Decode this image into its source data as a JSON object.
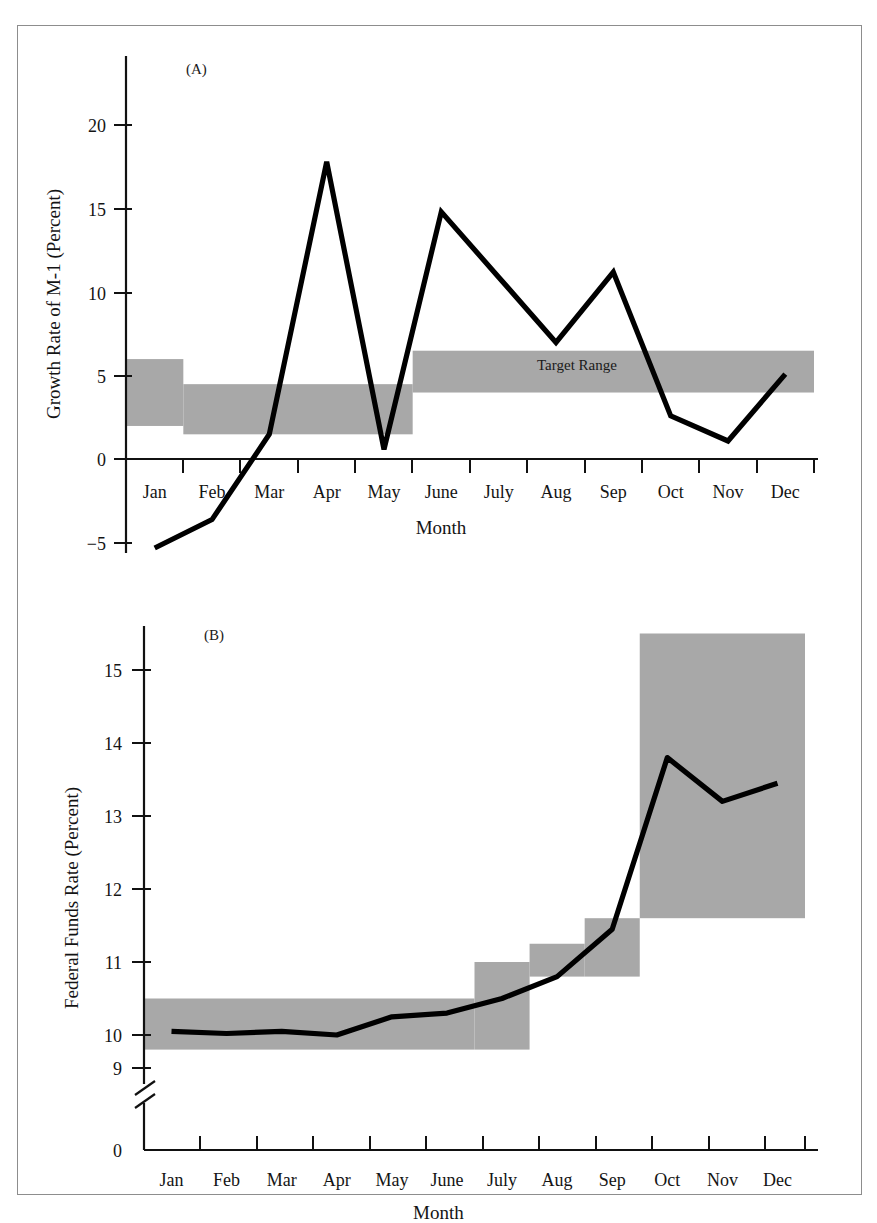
{
  "figure": {
    "background": "#ffffff",
    "border_color": "#8d8d8d",
    "line_color": "#000000",
    "band_color": "#a8a8a8"
  },
  "panel_a": {
    "label": "(A)",
    "band_annotation": "Target Range",
    "ylabel": "Growth Rate of M-1 (Percent)",
    "xlabel": "Month"
  },
  "panel_b": {
    "label": "(B)",
    "ylabel": "Federal Funds Rate (Percent)",
    "xlabel": "Month",
    "axis_break": "axis-break-mark"
  },
  "chart_data": [
    {
      "type": "line",
      "id": "panel-a",
      "title": "(A)",
      "xlabel": "Month",
      "ylabel": "Growth Rate of M-1 (Percent)",
      "categories": [
        "Jan",
        "Feb",
        "Mar",
        "Apr",
        "May",
        "June",
        "July",
        "Aug",
        "Sep",
        "Oct",
        "Nov",
        "Dec"
      ],
      "values": [
        -5.3,
        -3.6,
        1.5,
        17.8,
        0.6,
        14.8,
        10.9,
        7.0,
        11.2,
        2.6,
        1.1,
        5.1
      ],
      "ytick_labels": [
        "20",
        "15",
        "10",
        "5",
        "0",
        "-5"
      ],
      "ytick_values": [
        20,
        15,
        10,
        5,
        0,
        -5
      ],
      "ylim": [
        -7,
        22.5
      ],
      "grid": false,
      "legend": "none",
      "annotations": [
        {
          "text": "Target Range",
          "x_category": "June",
          "y": 5.3
        }
      ],
      "bands": [
        {
          "name": "target-range-q1",
          "start_month": "Jan",
          "end_month": "Feb",
          "low": 2.0,
          "high": 6.0
        },
        {
          "name": "target-range-q2",
          "start_month": "Feb",
          "end_month": "June",
          "low": 1.5,
          "high": 4.5
        },
        {
          "name": "target-range-q3",
          "start_month": "June",
          "end_month": "Dec",
          "low": 4.0,
          "high": 6.5
        }
      ]
    },
    {
      "type": "line",
      "id": "panel-b",
      "title": "(B)",
      "xlabel": "Month",
      "ylabel": "Federal Funds Rate (Percent)",
      "categories": [
        "Jan",
        "Feb",
        "Mar",
        "Apr",
        "May",
        "June",
        "July",
        "Aug",
        "Sep",
        "Oct",
        "Nov",
        "Dec"
      ],
      "values": [
        10.05,
        10.02,
        10.05,
        10.0,
        10.25,
        10.3,
        10.5,
        10.8,
        11.45,
        13.8,
        13.2,
        13.45
      ],
      "ytick_labels": [
        "15",
        "14",
        "13",
        "12",
        "11",
        "10",
        "9",
        "0"
      ],
      "ytick_values": [
        15,
        14,
        13,
        12,
        11,
        10,
        9,
        0
      ],
      "ylim": [
        8.6,
        15.7
      ],
      "axis_break_between": [
        0,
        9
      ],
      "grid": false,
      "legend": "none",
      "bands": [
        {
          "name": "ffr-band-1",
          "start_month": "Jan",
          "end_month": "July",
          "low": 9.8,
          "high": 10.5
        },
        {
          "name": "ffr-band-2",
          "start_month": "July",
          "end_month": "Aug",
          "low": 9.8,
          "high": 11.0
        },
        {
          "name": "ffr-band-3",
          "start_month": "Aug",
          "end_month": "Sep",
          "low": 10.8,
          "high": 11.25
        },
        {
          "name": "ffr-band-4",
          "start_month": "Sep",
          "end_month": "Oct",
          "low": 10.8,
          "high": 11.6
        },
        {
          "name": "ffr-band-5",
          "start_month": "Oct",
          "end_month": "Dec",
          "low": 11.6,
          "high": 15.5
        }
      ]
    }
  ]
}
